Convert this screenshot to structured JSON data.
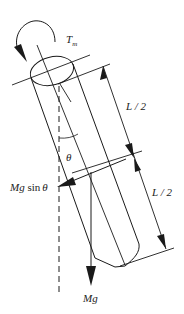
{
  "diagram": {
    "labels": {
      "torque": "T",
      "torque_sub": "m",
      "upper_half": "L / 2",
      "lower_half": "L / 2",
      "angle": "θ",
      "tangential_force_mg": "Mg",
      "tangential_force_sin": " sin",
      "tangential_force_theta": "θ",
      "weight": "Mg"
    },
    "colors": {
      "stroke": "#1a1a1a",
      "background": "#ffffff"
    }
  }
}
